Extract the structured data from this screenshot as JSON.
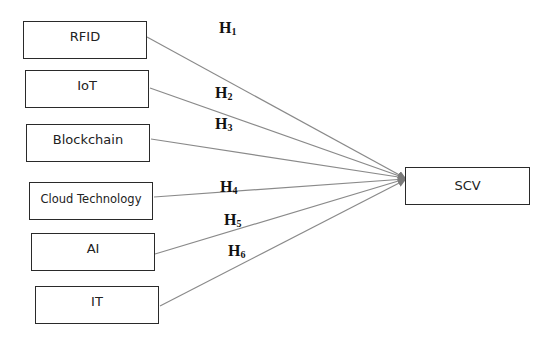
{
  "diagram": {
    "type": "research-model",
    "independent_variables": [
      {
        "id": "rfid",
        "label": "RFID",
        "x": 23,
        "y": 21,
        "w": 124,
        "h": 38
      },
      {
        "id": "iot",
        "label": "IoT",
        "x": 25,
        "y": 70,
        "w": 124,
        "h": 38
      },
      {
        "id": "blockchain",
        "label": "Blockchain",
        "x": 26,
        "y": 124,
        "w": 124,
        "h": 38
      },
      {
        "id": "cloud",
        "label": "Cloud Technology",
        "x": 29,
        "y": 182,
        "w": 124,
        "h": 38
      },
      {
        "id": "ai",
        "label": "AI",
        "x": 31,
        "y": 233,
        "w": 124,
        "h": 38
      },
      {
        "id": "it",
        "label": "IT",
        "x": 35,
        "y": 286,
        "w": 124,
        "h": 38
      }
    ],
    "dependent_variable": {
      "id": "scv",
      "label": "SCV",
      "x": 405,
      "y": 167,
      "w": 125,
      "h": 38
    },
    "hypotheses": [
      {
        "label": "H",
        "sub": "1",
        "from": "rfid",
        "to": "scv"
      },
      {
        "label": "H",
        "sub": "2",
        "from": "iot",
        "to": "scv"
      },
      {
        "label": "H",
        "sub": "3",
        "from": "blockchain",
        "to": "scv"
      },
      {
        "label": "H",
        "sub": "4",
        "from": "cloud",
        "to": "scv"
      },
      {
        "label": "H",
        "sub": "5",
        "from": "ai",
        "to": "scv"
      },
      {
        "label": "H",
        "sub": "6",
        "from": "it",
        "to": "scv"
      }
    ],
    "line_color": "#8a8a8a",
    "border_color": "#2a2a2a"
  }
}
